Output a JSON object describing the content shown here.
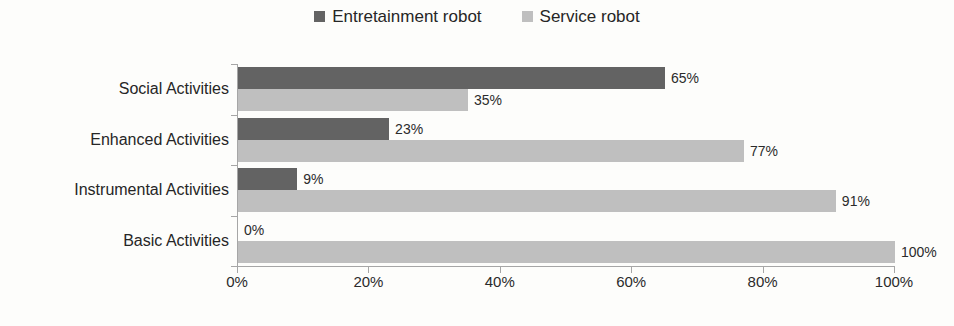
{
  "chart_data": {
    "type": "bar",
    "orientation": "horizontal",
    "title": "",
    "xlabel": "",
    "ylabel": "",
    "xlim": [
      0,
      100
    ],
    "grid": false,
    "legend_position": "top-center",
    "categories": [
      "Social Activities",
      "Enhanced Activities",
      "Instrumental Activities",
      "Basic Activities"
    ],
    "series": [
      {
        "name": "Entretainment robot",
        "color": "#636363",
        "values": [
          65,
          23,
          9,
          0
        ],
        "labels": [
          "65%",
          "23%",
          "9%",
          "0%"
        ]
      },
      {
        "name": "Service robot",
        "color": "#bfbfbf",
        "values": [
          35,
          77,
          91,
          100
        ],
        "labels": [
          "35%",
          "77%",
          "91%",
          "100%"
        ]
      }
    ],
    "xticks": [
      0,
      20,
      40,
      60,
      80,
      100
    ],
    "xtick_labels": [
      "0%",
      "20%",
      "40%",
      "60%",
      "80%",
      "100%"
    ],
    "axis_color": "#a6a6a6",
    "background": "#fdfdfb"
  }
}
